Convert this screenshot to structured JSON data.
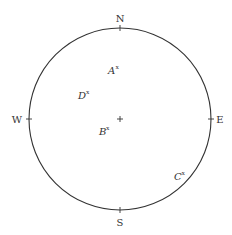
{
  "diagram": {
    "type": "sky-dome / horizon compass circle",
    "circle": {
      "cx": 120,
      "cy": 119,
      "r": 91,
      "stroke": "#333333"
    },
    "center_mark": {
      "symbol": "+",
      "x": 120,
      "y": 119
    },
    "compass": [
      {
        "id": "N",
        "label": "N",
        "x": 120,
        "y": 22
      },
      {
        "id": "S",
        "label": "S",
        "x": 120,
        "y": 225
      },
      {
        "id": "W",
        "label": "W",
        "x": 15,
        "y": 123
      },
      {
        "id": "E",
        "label": "E",
        "x": 219,
        "y": 123
      }
    ],
    "points": [
      {
        "id": "A",
        "label": "A",
        "mark": "x",
        "x": 109,
        "y": 74
      },
      {
        "id": "D",
        "label": "D",
        "mark": "x",
        "x": 79,
        "y": 99
      },
      {
        "id": "B",
        "label": "B",
        "mark": "x",
        "x": 100,
        "y": 134
      },
      {
        "id": "C",
        "label": "C",
        "mark": "x",
        "x": 175,
        "y": 179
      }
    ]
  }
}
